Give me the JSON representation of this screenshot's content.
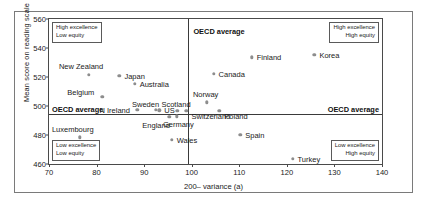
{
  "chart_data": {
    "type": "scatter",
    "title": "",
    "xlabel": "200– variance (a)",
    "ylabel": "Mean score on reading scale",
    "xlim": [
      70,
      140
    ],
    "ylim": [
      460,
      560
    ],
    "xticks": [
      70,
      80,
      90,
      100,
      110,
      120,
      130,
      140
    ],
    "yticks": [
      460,
      480,
      500,
      520,
      540,
      560
    ],
    "grid": false,
    "legend": "none",
    "reference_lines": {
      "horizontal": {
        "label": "OECD average",
        "value": 494.5
      },
      "vertical": {
        "label": "OECD average",
        "value": 99.3
      }
    },
    "reference_label_left": "OECD average",
    "reference_label_right": "OECD average",
    "reference_label_top": "OECD average",
    "quadrant_notes": [
      {
        "position": "top-left",
        "lines": [
          "High excellence",
          "Low equity"
        ],
        "align": "left"
      },
      {
        "position": "top-right",
        "lines": [
          "High excellence",
          "High equity"
        ],
        "align": "right"
      },
      {
        "position": "bottom-left",
        "lines": [
          "Low excellence",
          "Low equity"
        ],
        "align": "left"
      },
      {
        "position": "bottom-right",
        "lines": [
          "Low excellence",
          "High equity"
        ],
        "align": "right"
      }
    ],
    "points": [
      {
        "name": "New Zealand",
        "x": 78.4,
        "y": 521.5,
        "label_dx": -30,
        "label_dy": -13
      },
      {
        "name": "Japan",
        "x": 84.8,
        "y": 521.0,
        "label_dx": 5,
        "label_dy": -4
      },
      {
        "name": "Australia",
        "x": 88.0,
        "y": 515.5,
        "label_dx": 5,
        "label_dy": -4
      },
      {
        "name": "Belgium",
        "x": 81.2,
        "y": 506.5,
        "label_dx": -35,
        "label_dy": -9
      },
      {
        "name": "N Ireland",
        "x": 88.6,
        "y": 497.5,
        "label_dx": -38,
        "label_dy": -4
      },
      {
        "name": "Sweden",
        "x": 92.5,
        "y": 497.5,
        "label_dx": -24,
        "label_dy": -10
      },
      {
        "name": "US",
        "x": 93.2,
        "y": 497.0,
        "label_dx": 5,
        "label_dy": -4
      },
      {
        "name": "England",
        "x": 95.3,
        "y": 492.5,
        "label_dx": -27,
        "label_dy": 4
      },
      {
        "name": "Scotland",
        "x": 97.0,
        "y": 496.5,
        "label_dx": -16,
        "label_dy": -11
      },
      {
        "name": "Germany",
        "x": 96.9,
        "y": 493.0,
        "label_dx": -14,
        "label_dy": 4
      },
      {
        "name": "Switzerland",
        "x": 98.9,
        "y": 496.5,
        "label_dx": 5,
        "label_dy": 1
      },
      {
        "name": "Norway",
        "x": 103.2,
        "y": 502.5,
        "label_dx": -14,
        "label_dy": -12
      },
      {
        "name": "Poland",
        "x": 105.8,
        "y": 496.5,
        "label_dx": 5,
        "label_dy": 1
      },
      {
        "name": "Canada",
        "x": 104.6,
        "y": 522.0,
        "label_dx": 5,
        "label_dy": -4
      },
      {
        "name": "Finland",
        "x": 112.6,
        "y": 533.5,
        "label_dx": 5,
        "label_dy": -4
      },
      {
        "name": "Korea",
        "x": 125.8,
        "y": 535.5,
        "label_dx": 5,
        "label_dy": -4
      },
      {
        "name": "Luxembourg",
        "x": 76.5,
        "y": 478.5,
        "label_dx": -28,
        "label_dy": -12
      },
      {
        "name": "Wales",
        "x": 95.8,
        "y": 476.5,
        "label_dx": 5,
        "label_dy": -4
      },
      {
        "name": "Spain",
        "x": 110.2,
        "y": 480.0,
        "label_dx": 5,
        "label_dy": -4
      },
      {
        "name": "Turkey",
        "x": 121.2,
        "y": 463.5,
        "label_dx": 5,
        "label_dy": -4
      }
    ]
  }
}
